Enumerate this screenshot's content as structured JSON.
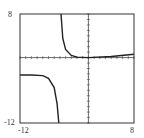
{
  "chart_data": {
    "type": "line",
    "title": "",
    "xlabel": "",
    "ylabel": "",
    "xlim": [
      -12,
      8
    ],
    "ylim": [
      -12,
      8
    ],
    "x_tick_labels": [
      "-12",
      "8"
    ],
    "y_tick_labels": [
      "8",
      "-12"
    ],
    "grid": false,
    "axes_ticks": "unit tick marks along both axes",
    "vertical_asymptote_x": -5,
    "series": [
      {
        "name": "left branch",
        "x": [
          -12,
          -10,
          -8,
          -7,
          -6,
          -5.5,
          -5.2
        ],
        "y": [
          -3.2,
          -3.2,
          -3.3,
          -3.8,
          -5.5,
          -8.5,
          -12
        ]
      },
      {
        "name": "right branch",
        "x": [
          -4.8,
          -4.5,
          -4,
          -3,
          -2,
          0,
          4,
          8
        ],
        "y": [
          8,
          3.5,
          1.5,
          0.4,
          0.1,
          0,
          0.2,
          0.6
        ]
      }
    ]
  },
  "labels": {
    "y_max": "8",
    "y_min": "-12",
    "x_min": "-12",
    "x_max": "8"
  }
}
